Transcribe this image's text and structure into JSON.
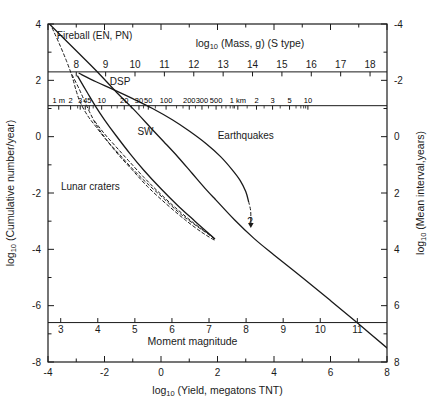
{
  "figure": {
    "background": "#ffffff",
    "line_color": "#1a1a1a"
  },
  "chart_data": {
    "type": "line",
    "title": "",
    "xlabel": "log10 (Yield, megatons TNT)",
    "ylabel": "log10 (Cumulative number/year)",
    "y2label": "log10 (Mean interval, years)",
    "top_axis_label": "log10 (Mass, g)  (S type)",
    "inner_axis_label": "Moment magnitude",
    "xlim": [
      -4,
      8
    ],
    "ylim": [
      -8,
      4
    ],
    "y2lim": [
      8,
      -4
    ],
    "grid": false,
    "legend": "inline-annotations",
    "axes": {
      "bottom": {
        "name": "log10 (Yield, megatons TNT)",
        "ticks": [
          -4,
          -2,
          0,
          2,
          4,
          6,
          8
        ],
        "tick_labels": [
          "-4",
          "-2",
          "0",
          "2",
          "4",
          "6",
          "8"
        ],
        "minor_step": 1
      },
      "left": {
        "name": "log10 (Cumulative number/year)",
        "ticks": [
          4,
          2,
          0,
          -2,
          -4,
          -6,
          -8
        ],
        "tick_labels": [
          "4",
          "2",
          "0",
          "-2",
          "-4",
          "-6",
          "-8"
        ],
        "minor_step": 1
      },
      "right": {
        "name": "log10 (Mean interval, years)",
        "ticks": [
          -4,
          -2,
          0,
          2,
          4,
          6,
          8
        ],
        "tick_labels": [
          "-4",
          "-2",
          "0",
          "2",
          "4",
          "6",
          "8"
        ],
        "minor_step": 1
      },
      "top_mass": {
        "name": "log10 (Mass, g)  (S type)",
        "axis_y_value": 2.3,
        "ticks": [
          8,
          9,
          10,
          11,
          12,
          13,
          14,
          15,
          16,
          17,
          18
        ],
        "tick_labels": [
          "8",
          "9",
          "10",
          "11",
          "12",
          "13",
          "14",
          "15",
          "16",
          "17",
          "18"
        ],
        "x_at_first_tick": -3.0,
        "x_at_last_tick": 7.4
      },
      "diameter": {
        "name": "impactor diameter",
        "axis_y_value": 1.1,
        "labels": [
          {
            "text": "1 m",
            "x": -3.62
          },
          {
            "text": "2",
            "x": -3.2
          },
          {
            "text": "3",
            "x": -2.86
          },
          {
            "text": "4",
            "x": -2.68
          },
          {
            "text": "5",
            "x": -2.54
          },
          {
            "text": "10",
            "x": -2.1
          },
          {
            "text": "20",
            "x": -1.3
          },
          {
            "text": "30",
            "x": -0.78
          },
          {
            "text": "50",
            "x": -0.45
          },
          {
            "text": "100",
            "x": 0.18
          },
          {
            "text": "200",
            "x": 1.0
          },
          {
            "text": "300",
            "x": 1.45
          },
          {
            "text": "500",
            "x": 1.95
          },
          {
            "text": "1 km",
            "x": 2.72
          },
          {
            "text": "2",
            "x": 3.38
          },
          {
            "text": "3",
            "x": 3.95
          },
          {
            "text": "5",
            "x": 4.55
          },
          {
            "text": "10",
            "x": 5.2
          }
        ]
      },
      "moment_magnitude": {
        "name": "Moment magnitude",
        "axis_y_value": -6.6,
        "ticks": [
          3,
          4,
          5,
          6,
          7,
          8,
          9,
          10,
          11
        ],
        "tick_labels": [
          "3",
          "4",
          "5",
          "6",
          "7",
          "8",
          "9",
          "10",
          "11"
        ],
        "x_at_first_tick": -3.55,
        "x_at_last_tick": 6.95
      }
    },
    "annotations": [
      {
        "text": "Fireball (EN, PN)",
        "x": -2.35,
        "y": 3.45,
        "name": "fireball-label"
      },
      {
        "text": "DSP",
        "x": -1.45,
        "y": 1.85,
        "name": "dsp-label"
      },
      {
        "text": "SW",
        "x": -0.55,
        "y": 0.05,
        "name": "sw-label"
      },
      {
        "text": "Earthquakes",
        "x": 3.0,
        "y": -0.1,
        "name": "earthquakes-label"
      },
      {
        "text": "Lunar craters",
        "x": -2.5,
        "y": -1.9,
        "name": "lunar-craters-label"
      },
      {
        "text": "?",
        "x": 3.15,
        "y": -3.15,
        "name": "question-mark-label"
      }
    ],
    "series": [
      {
        "name": "Fireball (EN, PN)",
        "style": "solid",
        "points": [
          [
            -3.95,
            4.0
          ],
          [
            -3.0,
            3.05
          ],
          [
            -2.3,
            2.35
          ],
          [
            -1.55,
            1.55
          ],
          [
            -0.95,
            0.95
          ],
          [
            -0.35,
            0.3
          ],
          [
            0.1,
            -0.18
          ],
          [
            0.6,
            -0.72
          ],
          [
            1.1,
            -1.3
          ],
          [
            1.6,
            -1.88
          ],
          [
            1.9,
            -2.2
          ]
        ]
      },
      {
        "name": "Main impact flux",
        "style": "solid",
        "points": [
          [
            1.9,
            -2.2
          ],
          [
            2.6,
            -2.95
          ],
          [
            3.3,
            -3.62
          ],
          [
            4.0,
            -4.2
          ],
          [
            5.0,
            -5.0
          ],
          [
            6.0,
            -5.82
          ],
          [
            7.0,
            -6.65
          ],
          [
            8.0,
            -7.5
          ]
        ]
      },
      {
        "name": "DSP",
        "style": "dashed",
        "points": [
          [
            -3.85,
            3.85
          ],
          [
            -3.6,
            3.3
          ],
          [
            -3.35,
            2.7
          ],
          [
            -3.15,
            2.15
          ],
          [
            -3.0,
            1.62
          ],
          [
            -2.85,
            1.2
          ],
          [
            -2.6,
            0.75
          ],
          [
            -2.3,
            0.35
          ],
          [
            -1.95,
            -0.1
          ],
          [
            -1.5,
            -0.6
          ],
          [
            -1.0,
            -1.15
          ],
          [
            -0.5,
            -1.65
          ],
          [
            0.1,
            -2.2
          ],
          [
            0.7,
            -2.75
          ],
          [
            1.3,
            -3.2
          ],
          [
            1.75,
            -3.52
          ],
          [
            1.9,
            -3.65
          ]
        ]
      },
      {
        "name": "SW",
        "style": "dashed",
        "points": [
          [
            -3.15,
            2.2
          ],
          [
            -2.9,
            1.7
          ],
          [
            -2.7,
            1.25
          ],
          [
            -2.5,
            0.82
          ],
          [
            -2.25,
            0.35
          ],
          [
            -1.9,
            -0.15
          ],
          [
            -1.5,
            -0.65
          ],
          [
            -1.0,
            -1.2
          ],
          [
            -0.45,
            -1.8
          ],
          [
            0.2,
            -2.4
          ],
          [
            0.85,
            -2.95
          ],
          [
            1.45,
            -3.4
          ],
          [
            1.9,
            -3.68
          ]
        ]
      },
      {
        "name": "Lunar craters",
        "style": "solid",
        "points": [
          [
            -2.95,
            2.15
          ],
          [
            -2.6,
            1.55
          ],
          [
            -2.3,
            1.05
          ],
          [
            -2.0,
            0.6
          ],
          [
            -1.6,
            0.05
          ],
          [
            -1.1,
            -0.6
          ],
          [
            -0.6,
            -1.2
          ],
          [
            0.0,
            -1.85
          ],
          [
            0.6,
            -2.45
          ],
          [
            1.2,
            -3.0
          ],
          [
            1.7,
            -3.45
          ],
          [
            1.9,
            -3.62
          ]
        ]
      },
      {
        "name": "Lunar craters upper",
        "style": "dashed",
        "points": [
          [
            -2.35,
            0.55
          ],
          [
            -2.0,
            0.1
          ],
          [
            -1.6,
            -0.35
          ],
          [
            -1.15,
            -0.85
          ],
          [
            -0.6,
            -1.45
          ],
          [
            0.0,
            -2.05
          ],
          [
            0.6,
            -2.6
          ],
          [
            1.2,
            -3.1
          ],
          [
            1.75,
            -3.5
          ],
          [
            1.9,
            -3.62
          ]
        ]
      },
      {
        "name": "Earthquakes",
        "style": "solid",
        "points": [
          [
            -2.9,
            2.25
          ],
          [
            -2.3,
            1.95
          ],
          [
            -1.7,
            1.68
          ],
          [
            -1.0,
            1.35
          ],
          [
            -0.3,
            1.0
          ],
          [
            0.4,
            0.6
          ],
          [
            1.0,
            0.2
          ],
          [
            1.6,
            -0.25
          ],
          [
            2.1,
            -0.7
          ],
          [
            2.5,
            -1.15
          ],
          [
            2.8,
            -1.55
          ],
          [
            3.0,
            -1.95
          ],
          [
            3.1,
            -2.3
          ]
        ]
      },
      {
        "name": "Earthquakes extrapolation",
        "style": "dashed",
        "points": [
          [
            3.1,
            -2.3
          ],
          [
            3.17,
            -2.6
          ],
          [
            3.18,
            -2.85
          ]
        ],
        "arrow_end": true
      }
    ],
    "horizontal_rules": [
      {
        "name": "mass-axis-rule",
        "y": 2.3
      },
      {
        "name": "diameter-axis-rule",
        "y": 1.1
      },
      {
        "name": "moment-magnitude-rule",
        "y": -6.6
      }
    ]
  }
}
